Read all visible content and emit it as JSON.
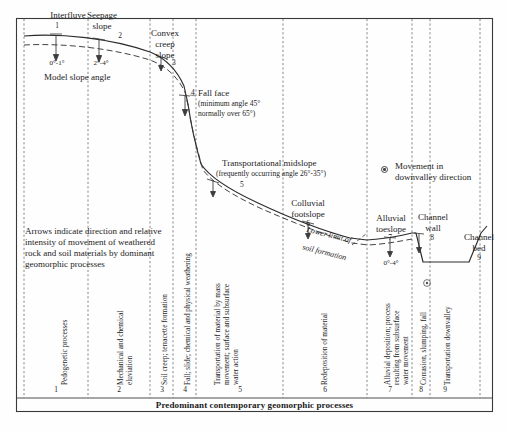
{
  "figure": {
    "caption": "Predominant contemporary geomorphic processes",
    "legend": {
      "symbol": "circled-dot-icon",
      "line1": "Movement in",
      "line2": "downvalley direction"
    },
    "note": {
      "line1": "Arrows indicate direction and relative",
      "line2": "intensity of movement of weathered",
      "line3": "rock and soil materials by dominant",
      "line4": "geomorphic processes"
    },
    "model_slope_angle_label": "Model slope angle",
    "soil_limit": {
      "line1": "Lower limit of",
      "line2": "soil formation"
    }
  },
  "units": [
    {
      "number": "1",
      "name_lines": [
        "Interfluve"
      ],
      "angle": "0°-1°",
      "process": "Pedogenetic processes"
    },
    {
      "number": "2",
      "name_lines": [
        "Seepage",
        "slope"
      ],
      "angle": "2°-4°",
      "process": "Mechanical and chemical\neluviation"
    },
    {
      "number": "3",
      "name_lines": [
        "Convex",
        "creep",
        "slope"
      ],
      "angle": "",
      "process": "Soil creep; terracette formation"
    },
    {
      "number": "4",
      "name_lines": [
        "Fall face"
      ],
      "detail_lines": [
        "(minimum angle 45°",
        "normally over 65°)"
      ],
      "angle": "",
      "process": "Fall; slide; chemical and physical weathering"
    },
    {
      "number": "5",
      "name_lines": [
        "Transportational midslope"
      ],
      "detail_lines": [
        "(frequently occurring angle 26°-35°)"
      ],
      "angle": "",
      "process": "Transportation of material by mass\nmovement; surface and subsurface\nwater action"
    },
    {
      "number": "6",
      "name_lines": [
        "Colluvial",
        "footslope"
      ],
      "angle": "",
      "process": "Redeposition of material"
    },
    {
      "number": "7",
      "name_lines": [
        "Alluvial",
        "toeslope"
      ],
      "angle": "0°-4°",
      "process": "Alluvial deposition; process\nresulting from subsurface\nwater movement"
    },
    {
      "number": "8",
      "name_lines": [
        "Channel",
        "wall"
      ],
      "angle": "",
      "process": "Corrasion, slumping, fall"
    },
    {
      "number": "9",
      "name_lines": [
        "Channel",
        "bed"
      ],
      "angle": "",
      "process": "Transportation downvalley"
    }
  ],
  "colors": {
    "line": "#2b2b2b",
    "dashed": "#3a3a3a",
    "text": "#1c1c1c",
    "frame": "#3a3a3a"
  }
}
